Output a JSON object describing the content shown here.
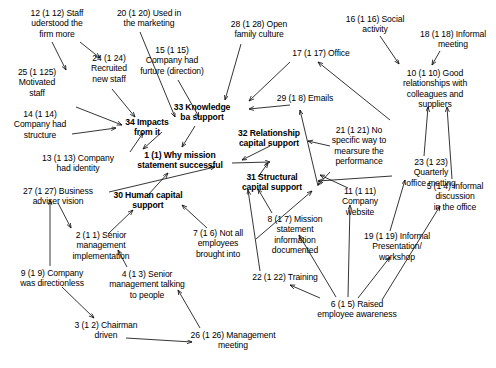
{
  "diagram": {
    "type": "concept-map",
    "background_color": "#ffffff",
    "text_color": "#000000",
    "nodes": [
      {
        "id": "n12",
        "label": "12 (1 12) Staff\nuderstood the\nfirm more",
        "x": 9,
        "y": 8,
        "w": 96,
        "bold": false
      },
      {
        "id": "n20",
        "label": "20 (1 20) Used in\nthe marketing",
        "x": 101,
        "y": 8,
        "w": 96,
        "bold": false
      },
      {
        "id": "n28",
        "label": "28 (1 28) Open\nfamily culture",
        "x": 215,
        "y": 19,
        "w": 88,
        "bold": false
      },
      {
        "id": "n16",
        "label": "16 (1 16) Social\nactivity",
        "x": 332,
        "y": 14,
        "w": 86,
        "bold": false
      },
      {
        "id": "n18",
        "label": "18 (1 18) Informal\nmeeting",
        "x": 410,
        "y": 29,
        "w": 86,
        "bold": false
      },
      {
        "id": "n17",
        "label": "17 (1 17) Office",
        "x": 281,
        "y": 48,
        "w": 80,
        "bold": false
      },
      {
        "id": "n15",
        "label": "15 (1 15)\nCompany had\nfurture (direction)",
        "x": 124,
        "y": 45,
        "w": 96,
        "bold": false
      },
      {
        "id": "n25",
        "label": "25 (1 125)\nMotivated\nstaff",
        "x": 4,
        "y": 67,
        "w": 66,
        "bold": false
      },
      {
        "id": "n24",
        "label": "24 (1 24)\nRecruited\nnew staff",
        "x": 76,
        "y": 53,
        "w": 66,
        "bold": false
      },
      {
        "id": "n10",
        "label": "10 (1 10) Good\nrelationships with\ncolleagues and\nsuppliers",
        "x": 386,
        "y": 68,
        "w": 98,
        "bold": false
      },
      {
        "id": "n29",
        "label": "29 (1 8) Emails",
        "x": 267,
        "y": 93,
        "w": 76,
        "bold": false
      },
      {
        "id": "n33",
        "label": "33 Knowledge\nba support",
        "x": 160,
        "y": 102,
        "w": 84,
        "bold": true
      },
      {
        "id": "n14",
        "label": "14 (1 14)\nCompany had\nstructure",
        "x": 1,
        "y": 109,
        "w": 78,
        "bold": false
      },
      {
        "id": "n21",
        "label": "21 (1 21) No\nspecific way to\nmearsure the\nperformance",
        "x": 318,
        "y": 125,
        "w": 82,
        "bold": false
      },
      {
        "id": "n32",
        "label": "32 Relationship\ncapital support",
        "x": 224,
        "y": 128,
        "w": 90,
        "bold": true
      },
      {
        "id": "n23",
        "label": "23 (1 23)\nQuarterly\noffice metting",
        "x": 394,
        "y": 157,
        "w": 74,
        "bold": false
      },
      {
        "id": "n1",
        "label": "1 (1) Why mission\nstatement successful",
        "x": 126,
        "y": 150,
        "w": 108,
        "bold": true
      },
      {
        "id": "n13",
        "label": "13 (1 13) Company\nhad identity",
        "x": 27,
        "y": 153,
        "w": 102,
        "bold": false
      },
      {
        "id": "n31",
        "label": "31 Structural\ncapital support",
        "x": 229,
        "y": 172,
        "w": 86,
        "bold": true
      },
      {
        "id": "n11",
        "label": "11 (1 11)\nCompany\nwebsite",
        "x": 329,
        "y": 186,
        "w": 62,
        "bold": false
      },
      {
        "id": "n5",
        "label": "5 (1 4) Informal\ndiscussion\nin the office",
        "x": 416,
        "y": 181,
        "w": 78,
        "bold": false
      },
      {
        "id": "n27",
        "label": "27 (1 27) Business\nadviser vision",
        "x": 7,
        "y": 186,
        "w": 102,
        "bold": false
      },
      {
        "id": "n30",
        "label": "30 Human capital\nsupport",
        "x": 99,
        "y": 190,
        "w": 98,
        "bold": true
      },
      {
        "id": "n8",
        "label": "8 (1 7) Mission\nstatement\ninformation\ndocumented",
        "x": 255,
        "y": 214,
        "w": 80,
        "bold": false
      },
      {
        "id": "n7",
        "label": "7 (1 6) Not all\nemployees\nbrought into",
        "x": 181,
        "y": 228,
        "w": 74,
        "bold": false
      },
      {
        "id": "n19",
        "label": "19 (1 19) Informal\nPresentation/\nworkshop",
        "x": 352,
        "y": 231,
        "w": 90,
        "bold": false
      },
      {
        "id": "n2",
        "label": "2 (1 1) Senior\nmanagement\nimplementation",
        "x": 57,
        "y": 230,
        "w": 88,
        "bold": false
      },
      {
        "id": "n9",
        "label": "9 (1 9) Company\nwas directionless",
        "x": 4,
        "y": 268,
        "w": 96,
        "bold": false
      },
      {
        "id": "n4",
        "label": "4 (1 3) Senior\nmanagement talking\nto people",
        "x": 95,
        "y": 269,
        "w": 104,
        "bold": false
      },
      {
        "id": "n22",
        "label": "22 (1 22) Training",
        "x": 241,
        "y": 272,
        "w": 88,
        "bold": false
      },
      {
        "id": "n6",
        "label": "6 (1 5) Raised\nemployee awareness",
        "x": 302,
        "y": 299,
        "w": 110,
        "bold": false
      },
      {
        "id": "n3",
        "label": "3 (1 2) Chairman\ndriven",
        "x": 60,
        "y": 320,
        "w": 92,
        "bold": false
      },
      {
        "id": "n26",
        "label": "26 (1 26) Management\nmeeting",
        "x": 175,
        "y": 330,
        "w": 116,
        "bold": false
      }
    ],
    "edges": [
      {
        "from": "n12",
        "to": "n25",
        "path": "M 52,42 L 66,70"
      },
      {
        "from": "n12",
        "to": "n24",
        "path": "M 80,42 L 100,58"
      },
      {
        "from": "n20",
        "to": "n34",
        "path": "M 140,32 L 175,117"
      },
      {
        "from": "n15",
        "to": "n34",
        "path": "M 178,80 L 199,117"
      },
      {
        "from": "n24",
        "to": "n34",
        "path": "M 112,89 L 135,117"
      },
      {
        "from": "n25",
        "to": "n34",
        "path": "M 76,107 L 122,125"
      },
      {
        "from": "n14",
        "to": "n34",
        "path": "M 72,134 L 116,128"
      },
      {
        "from": "n13",
        "to": "n34",
        "path": "M 130,152 L 143,133"
      },
      {
        "from": "n28",
        "to": "n33",
        "path": "M 241,44 L 225,100"
      },
      {
        "from": "n17",
        "to": "n33",
        "path": "M 290,62 L 249,101"
      },
      {
        "from": "n33",
        "to": "n1",
        "path": "M 195,126 L 182,147"
      },
      {
        "from": "n34",
        "to": "n1",
        "path": "M 162,132 L 143,149"
      },
      {
        "from": "n29",
        "to": "n33",
        "path": "M 290,105 L 249,109"
      },
      {
        "from": "n32",
        "to": "n1",
        "path": "M 270,146 L 242,160"
      },
      {
        "from": "n1",
        "to": "n32",
        "path": "M 232,163 L 270,162"
      },
      {
        "from": "n30",
        "to": "n1",
        "path": "M 148,195 L 168,173"
      },
      {
        "from": "n27",
        "to": "n1",
        "path": "M 109,192 L 215,167"
      },
      {
        "from": "n31",
        "to": "n32",
        "path": "M 258,177 L 268,163"
      },
      {
        "from": "n2",
        "to": "n30",
        "path": "M 108,234 L 133,210"
      },
      {
        "from": "n27",
        "to": "n2",
        "path": "M 58,203 L 71,228"
      },
      {
        "from": "n9",
        "to": "n27",
        "path": "M 50,266 L 50,200"
      },
      {
        "from": "n4",
        "to": "n2",
        "path": "M 127,267 L 118,250"
      },
      {
        "from": "n9",
        "to": "n3",
        "path": "M 62,287 L 94,318"
      },
      {
        "from": "n3",
        "to": "n26",
        "path": "M 126,338 L 192,342"
      },
      {
        "from": "n26",
        "to": "n4",
        "path": "M 200,328 L 178,290"
      },
      {
        "from": "n7",
        "to": "n30",
        "path": "M 207,228 L 182,205"
      },
      {
        "from": "n8",
        "to": "n31",
        "path": "M 272,213 L 258,189"
      },
      {
        "from": "n22",
        "to": "n31",
        "path": "M 260,271 L 248,190"
      },
      {
        "from": "n6",
        "to": "n22",
        "path": "M 320,298 L 290,285"
      },
      {
        "from": "n6",
        "to": "n8",
        "path": "M 336,297 L 299,235"
      },
      {
        "from": "n6",
        "to": "n19",
        "path": "M 358,298 L 390,257"
      },
      {
        "from": "n6",
        "to": "n5",
        "path": "M 382,300 L 440,206"
      },
      {
        "from": "n6",
        "to": "n11",
        "path": "M 348,297 L 350,205"
      },
      {
        "from": "n11",
        "to": "n21",
        "path": "M 348,188 L 320,175"
      },
      {
        "from": "n21",
        "to": "n32",
        "path": "M 330,146 L 308,141"
      },
      {
        "from": "n23",
        "to": "n10",
        "path": "M 424,156 L 428,107"
      },
      {
        "from": "n16",
        "to": "n10",
        "path": "M 380,36 L 399,64"
      },
      {
        "from": "n18",
        "to": "n10",
        "path": "M 440,51 L 432,65"
      },
      {
        "from": "n5",
        "to": "n10",
        "path": "M 452,179 L 447,107"
      },
      {
        "from": "n19",
        "to": "n23",
        "path": "M 390,231 L 405,180"
      },
      {
        "from": "n11",
        "to": "n29",
        "path": "M 318,186 L 300,110"
      },
      {
        "from": "n10",
        "to": "n17",
        "path": "M 390,120 L 318,62"
      },
      {
        "from": "n21",
        "to": "n31",
        "path": "M 330,172 L 318,185"
      },
      {
        "from": "n23",
        "to": "n31",
        "path": "M 392,176 L 318,181"
      },
      {
        "from": "n7",
        "to": "n31",
        "path": "M 256,239 L 312,191"
      }
    ]
  }
}
